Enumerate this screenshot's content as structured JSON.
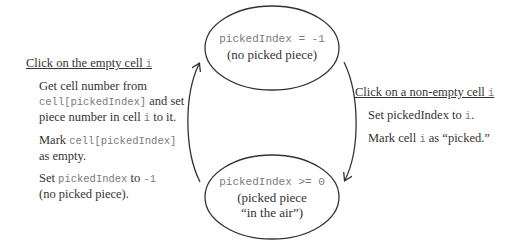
{
  "states": {
    "idle": {
      "code": "pickedIndex = -1",
      "caption": "(no picked piece)"
    },
    "picked": {
      "code": "pickedIndex >= 0",
      "caption_line1": "(picked piece",
      "caption_line2": "“in the air”)"
    }
  },
  "transitions": {
    "drop": {
      "title_text": "Click on the empty cell ",
      "title_var": "i",
      "steps": [
        {
          "parts": [
            "Get cell number from",
            "cell[pickedIndex]",
            " and set piece number in cell ",
            "i",
            " to it."
          ]
        },
        {
          "parts": [
            "Mark ",
            "cell[pickedIndex]",
            " as empty."
          ]
        },
        {
          "parts": [
            "Set ",
            "pickedIndex",
            " to ",
            "-1",
            " (no picked piece)."
          ]
        }
      ]
    },
    "pick": {
      "title_text": "Click on a non-empty cell ",
      "title_var": "i",
      "steps": [
        {
          "parts": [
            "Set pickedIndex to ",
            "i",
            "."
          ]
        },
        {
          "parts": [
            "Mark cell ",
            "i",
            " as “picked.”"
          ]
        }
      ]
    }
  },
  "colors": {
    "stroke": "#333333",
    "text": "#2a2a2a",
    "code": "#7a7a7a"
  }
}
